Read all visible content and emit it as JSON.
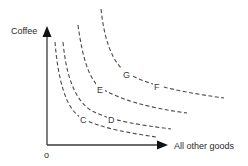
{
  "diagram": {
    "type": "indifference-curves",
    "y_axis_label": "Coffee",
    "x_axis_label": "All other goods",
    "origin_label": "o",
    "colors": {
      "axis": "#3a3a3a",
      "curve": "#4a4a4a",
      "text": "#2b2b2b",
      "background": "#ffffff"
    },
    "curves": [
      {
        "id": "curve-1",
        "points_labeled": [
          "C"
        ]
      },
      {
        "id": "curve-2",
        "points_labeled": [
          "D"
        ]
      },
      {
        "id": "curve-3",
        "points_labeled": [
          "E"
        ]
      },
      {
        "id": "curve-4",
        "points_labeled": [
          "G",
          "F"
        ]
      }
    ],
    "points": {
      "C": "C",
      "D": "D",
      "E": "E",
      "F": "F",
      "G": "G"
    }
  }
}
